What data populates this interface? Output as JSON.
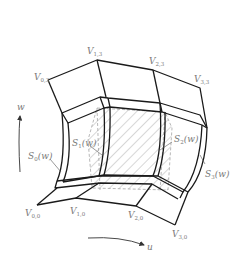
{
  "figure": {
    "type": "surface-patch-diagram",
    "colors": {
      "stroke": "#1a1a1a",
      "label": "#7a7a7a",
      "hatch": "#9a9a9a",
      "background": "#ffffff"
    },
    "vertices_top": [
      {
        "id": "V03",
        "base": "V",
        "sub": "0,3"
      },
      {
        "id": "V13",
        "base": "V",
        "sub": "1,3"
      },
      {
        "id": "V23",
        "base": "V",
        "sub": "2,3"
      },
      {
        "id": "V33",
        "base": "V",
        "sub": "3,3"
      }
    ],
    "vertices_bottom": [
      {
        "id": "V00",
        "base": "V",
        "sub": "0,0"
      },
      {
        "id": "V10",
        "base": "V",
        "sub": "1,0"
      },
      {
        "id": "V20",
        "base": "V",
        "sub": "2,0"
      },
      {
        "id": "V30",
        "base": "V",
        "sub": "3,0"
      }
    ],
    "curves": [
      {
        "id": "S0",
        "base": "S",
        "sub": "0",
        "arg": "(w)"
      },
      {
        "id": "S1",
        "base": "S",
        "sub": "1",
        "arg": "(w)"
      },
      {
        "id": "S2",
        "base": "S",
        "sub": "2",
        "arg": "(w)"
      },
      {
        "id": "S3",
        "base": "S",
        "sub": "3",
        "arg": "(w)"
      }
    ],
    "axes": {
      "w": {
        "label": "w",
        "direction": "up"
      },
      "u": {
        "label": "u",
        "direction": "right"
      }
    }
  }
}
